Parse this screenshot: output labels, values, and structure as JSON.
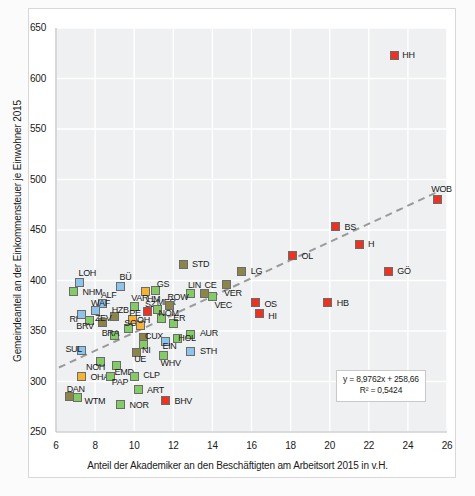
{
  "chart_data": {
    "type": "scatter",
    "title": "",
    "xlabel": "Anteil der Akademiker an den Beschäftigten am Arbeitsort 2015 in v.H.",
    "ylabel": "Gemeindeanteil an der Einkommensteuer je Einwohner 2015",
    "xlim": [
      6,
      26
    ],
    "ylim": [
      250,
      650
    ],
    "xticks": [
      6,
      8,
      10,
      12,
      14,
      16,
      18,
      20,
      22,
      24,
      26
    ],
    "yticks": [
      250,
      300,
      350,
      400,
      450,
      500,
      550,
      600,
      650
    ],
    "grid": true,
    "legend": "none",
    "trendline": {
      "type": "linear-dashed",
      "equation": "y = 8,9762x + 258,66",
      "r2": "R² = 0,5424",
      "slope": 8.9762,
      "intercept": 258.66,
      "color": "#9a9a9a"
    },
    "marker_colors": {
      "red": "#ea3323",
      "blue": "#8fc4ea",
      "green": "#84cb67",
      "orange": "#f5b335",
      "olive": "#8c8549"
    },
    "points": [
      {
        "label": "HH",
        "x": 23.3,
        "y": 623,
        "color": "red",
        "lx": 8,
        "ly": -2
      },
      {
        "label": "WOB",
        "x": 25.5,
        "y": 480,
        "color": "red",
        "lx": -6,
        "ly": -13
      },
      {
        "label": "BS",
        "x": 20.3,
        "y": 453,
        "color": "red",
        "lx": 9,
        "ly": -2
      },
      {
        "label": "H",
        "x": 21.5,
        "y": 436,
        "color": "red",
        "lx": 9,
        "ly": -2
      },
      {
        "label": "GÖ",
        "x": 23.0,
        "y": 409,
        "color": "red",
        "lx": 9,
        "ly": -2
      },
      {
        "label": "OL",
        "x": 18.1,
        "y": 425,
        "color": "red",
        "lx": 9,
        "ly": -1
      },
      {
        "label": "HB",
        "x": 19.9,
        "y": 378,
        "color": "red",
        "lx": 9,
        "ly": -2
      },
      {
        "label": "OS",
        "x": 16.2,
        "y": 378,
        "color": "red",
        "lx": 9,
        "ly": -1
      },
      {
        "label": "HI",
        "x": 16.4,
        "y": 367,
        "color": "red",
        "lx": 9,
        "ly": 0
      },
      {
        "label": "BHV",
        "x": 11.6,
        "y": 281,
        "color": "red",
        "lx": 9,
        "ly": -2
      },
      {
        "label": "STD",
        "x": 12.5,
        "y": 416,
        "color": "olive",
        "lx": 9,
        "ly": -2
      },
      {
        "label": "LG",
        "x": 15.5,
        "y": 409,
        "color": "olive",
        "lx": 9,
        "ly": -2
      },
      {
        "label": "VER",
        "x": 14.7,
        "y": 396,
        "color": "olive",
        "lx": -2,
        "ly": 6
      },
      {
        "label": "CE",
        "x": 13.6,
        "y": 387,
        "color": "olive",
        "lx": 0,
        "ly": -11
      },
      {
        "label": "LIN",
        "x": 12.9,
        "y": 387,
        "color": "green",
        "lx": -3,
        "ly": -11
      },
      {
        "label": "VEC",
        "x": 14.0,
        "y": 384,
        "color": "green",
        "lx": 2,
        "ly": 6
      },
      {
        "label": "AUR",
        "x": 12.9,
        "y": 347,
        "color": "green",
        "lx": 9,
        "ly": -3
      },
      {
        "label": "STH",
        "x": 12.9,
        "y": 330,
        "color": "blue",
        "lx": 9,
        "ly": -2
      },
      {
        "label": "LOH",
        "x": 7.2,
        "y": 398,
        "color": "blue",
        "lx": -1,
        "ly": -12
      },
      {
        "label": "NHM",
        "x": 6.9,
        "y": 389,
        "color": "green",
        "lx": 9,
        "ly": -2
      },
      {
        "label": "BÜ",
        "x": 9.3,
        "y": 394,
        "color": "blue",
        "lx": -1,
        "ly": -12
      },
      {
        "label": "HM",
        "x": 10.6,
        "y": 389,
        "color": "orange",
        "lx": 1,
        "ly": 5
      },
      {
        "label": "GS",
        "x": 11.1,
        "y": 390,
        "color": "green",
        "lx": 1,
        "ly": -9
      },
      {
        "label": "ALF",
        "x": 8.4,
        "y": 377,
        "color": "blue",
        "lx": -2,
        "ly": -11
      },
      {
        "label": "VAR",
        "x": 10.0,
        "y": 374,
        "color": "green",
        "lx": -3,
        "ly": -11
      },
      {
        "label": "SZ",
        "x": 10.7,
        "y": 369,
        "color": "red",
        "lx": -3,
        "ly": -10
      },
      {
        "label": "MER",
        "x": 11.2,
        "y": 371,
        "color": "green",
        "lx": -1,
        "ly": -10
      },
      {
        "label": "ROW",
        "x": 11.8,
        "y": 375,
        "color": "olive",
        "lx": -2,
        "ly": -11
      },
      {
        "label": "WAF",
        "x": 8.0,
        "y": 370,
        "color": "blue",
        "lx": -4,
        "ly": -10
      },
      {
        "label": "RI",
        "x": 7.3,
        "y": 366,
        "color": "blue",
        "lx": -12,
        "ly": 2
      },
      {
        "label": "HZB",
        "x": 9.0,
        "y": 364,
        "color": "olive",
        "lx": -3,
        "ly": -9
      },
      {
        "label": "PE",
        "x": 9.9,
        "y": 361,
        "color": "orange",
        "lx": -3,
        "ly": -9
      },
      {
        "label": "NOM",
        "x": 11.4,
        "y": 362,
        "color": "green",
        "lx": -3,
        "ly": -8
      },
      {
        "label": "BRV",
        "x": 7.7,
        "y": 360,
        "color": "green",
        "lx": -13,
        "ly": 3
      },
      {
        "label": "ZEV",
        "x": 8.4,
        "y": 358,
        "color": "olive",
        "lx": -8,
        "ly": -7
      },
      {
        "label": "ER",
        "x": 12.0,
        "y": 357,
        "color": "green",
        "lx": 0,
        "ly": -8
      },
      {
        "label": "SOH",
        "x": 9.7,
        "y": 352,
        "color": "green",
        "lx": -4,
        "ly": -8
      },
      {
        "label": "OH",
        "x": 10.3,
        "y": 355,
        "color": "orange",
        "lx": -3,
        "ly": -8
      },
      {
        "label": "BRA",
        "x": 9.0,
        "y": 346,
        "color": "green",
        "lx": -13,
        "ly": -4
      },
      {
        "label": "CUX",
        "x": 10.5,
        "y": 344,
        "color": "olive",
        "lx": 1,
        "ly": -3
      },
      {
        "label": "HOL",
        "x": 12.2,
        "y": 343,
        "color": "green",
        "lx": 1,
        "ly": -2
      },
      {
        "label": "EIN",
        "x": 11.6,
        "y": 340,
        "color": "blue",
        "lx": -3,
        "ly": 3
      },
      {
        "label": "NI",
        "x": 10.5,
        "y": 337,
        "color": "green",
        "lx": -2,
        "ly": 4
      },
      {
        "label": "SUL",
        "x": 7.3,
        "y": 331,
        "color": "blue",
        "lx": -16,
        "ly": -3
      },
      {
        "label": "UE",
        "x": 10.1,
        "y": 329,
        "color": "olive",
        "lx": -2,
        "ly": 5
      },
      {
        "label": "WHV",
        "x": 11.5,
        "y": 326,
        "color": "green",
        "lx": -3,
        "ly": 6
      },
      {
        "label": "NOH",
        "x": 8.3,
        "y": 320,
        "color": "green",
        "lx": -15,
        "ly": 4
      },
      {
        "label": "EMD",
        "x": 9.1,
        "y": 316,
        "color": "green",
        "lx": -2,
        "ly": 5
      },
      {
        "label": "OHA",
        "x": 7.3,
        "y": 305,
        "color": "orange",
        "lx": 9,
        "ly": -1
      },
      {
        "label": "PAP",
        "x": 8.8,
        "y": 305,
        "color": "green",
        "lx": 1,
        "ly": 4
      },
      {
        "label": "CLP",
        "x": 10.0,
        "y": 305,
        "color": "green",
        "lx": 9,
        "ly": -3
      },
      {
        "label": "ART",
        "x": 10.2,
        "y": 292,
        "color": "green",
        "lx": 9,
        "ly": -2
      },
      {
        "label": "DAN",
        "x": 6.7,
        "y": 285,
        "color": "olive",
        "lx": -3,
        "ly": -10
      },
      {
        "label": "WTM",
        "x": 7.1,
        "y": 284,
        "color": "green",
        "lx": 7,
        "ly": 1
      },
      {
        "label": "NOR",
        "x": 9.3,
        "y": 277,
        "color": "green",
        "lx": 9,
        "ly": -2
      }
    ]
  }
}
